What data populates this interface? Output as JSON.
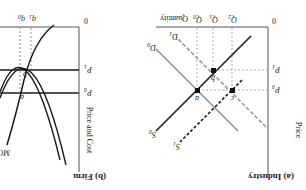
{
  "figure": {
    "orientation": "rotated-180",
    "panels": [
      {
        "id": "industry",
        "title": "(a) Industry",
        "y_axis_label": "Price",
        "x_axis_label": "Quantity",
        "origin_label": "0",
        "price_labels": {
          "p0": "P",
          "p0_sub": "0",
          "p1": "P",
          "p1_sub": "1"
        },
        "quantity_labels": [
          {
            "main": "Q",
            "sub": "0"
          },
          {
            "main": "Q",
            "sub": "1"
          },
          {
            "main": "Q",
            "sub": "2"
          }
        ],
        "curves": [
          {
            "label": "S",
            "sub": "0",
            "style": "solid-black"
          },
          {
            "label": "S",
            "sub": "1",
            "style": "dashed-black"
          },
          {
            "label": "D",
            "sub": "0",
            "style": "solid-gray"
          },
          {
            "label": "D",
            "sub": "1",
            "style": "dashed-gray"
          }
        ],
        "points": [
          "a",
          "b",
          "c"
        ]
      },
      {
        "id": "firm",
        "title": "(b) Firm",
        "y_axis_label": "Price and Cost",
        "x_axis_label": "Quantity",
        "origin_label": "0",
        "price_labels": {
          "p0": "P",
          "p0_sub": "0",
          "p1": "P",
          "p1_sub": "1"
        },
        "quantity_labels": [
          {
            "main": "q",
            "sub": "0"
          },
          {
            "main": "q",
            "sub": "1"
          }
        ],
        "curves": [
          {
            "label": "MC",
            "style": "solid-black"
          },
          {
            "label": "ATC",
            "style": "solid-black"
          }
        ],
        "points": [
          "a",
          "b"
        ]
      }
    ],
    "colors": {
      "black": "#1a1a1a",
      "gray": "#8a8a8a",
      "dash_gray": "#9a9a9a"
    }
  }
}
